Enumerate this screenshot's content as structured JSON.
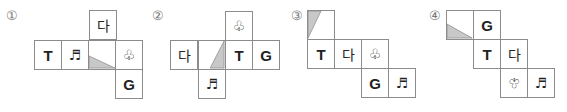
{
  "figures": [
    {
      "label": "①",
      "cells": [
        {
          "id": "f1-top",
          "text": "다",
          "kind": "ko"
        },
        {
          "id": "f1-t",
          "text": "T",
          "kind": "txt"
        },
        {
          "id": "f1-music",
          "text": "♬",
          "kind": "sym",
          "icon": "music-note-icon"
        },
        {
          "id": "f1-shaded",
          "text": "",
          "kind": "shaded"
        },
        {
          "id": "f1-club",
          "text": "♧",
          "kind": "sym",
          "icon": "club-icon"
        },
        {
          "id": "f1-g",
          "text": "G",
          "kind": "txt"
        }
      ]
    },
    {
      "label": "②",
      "cells": [
        {
          "id": "f2-club",
          "text": "♧",
          "kind": "sym",
          "icon": "club-icon"
        },
        {
          "id": "f2-da",
          "text": "다",
          "kind": "ko"
        },
        {
          "id": "f2-shaded",
          "text": "",
          "kind": "shaded"
        },
        {
          "id": "f2-t",
          "text": "T",
          "kind": "txt"
        },
        {
          "id": "f2-g",
          "text": "G",
          "kind": "txt"
        },
        {
          "id": "f2-music",
          "text": "♬",
          "kind": "sym",
          "icon": "music-note-icon"
        }
      ]
    },
    {
      "label": "③",
      "cells": [
        {
          "id": "f3-shaded",
          "text": "",
          "kind": "shaded"
        },
        {
          "id": "f3-t",
          "text": "T",
          "kind": "txt"
        },
        {
          "id": "f3-da",
          "text": "다",
          "kind": "ko"
        },
        {
          "id": "f3-club",
          "text": "♧",
          "kind": "sym",
          "icon": "club-icon"
        },
        {
          "id": "f3-g",
          "text": "G",
          "kind": "txt"
        },
        {
          "id": "f3-music",
          "text": "♬",
          "kind": "sym",
          "icon": "music-note-icon"
        }
      ]
    },
    {
      "label": "④",
      "cells": [
        {
          "id": "f4-shaded",
          "text": "",
          "kind": "shaded"
        },
        {
          "id": "f4-g",
          "text": "G",
          "kind": "txt"
        },
        {
          "id": "f4-t",
          "text": "T",
          "kind": "txt"
        },
        {
          "id": "f4-da",
          "text": "다",
          "kind": "ko"
        },
        {
          "id": "f4-club",
          "text": "♧",
          "kind": "sym",
          "icon": "club-icon"
        },
        {
          "id": "f4-music",
          "text": "♬",
          "kind": "sym",
          "icon": "music-note-icon"
        }
      ]
    }
  ],
  "colors": {
    "border": "#8c8c8c",
    "shade": "#c8c8c8",
    "text": "#222222"
  }
}
